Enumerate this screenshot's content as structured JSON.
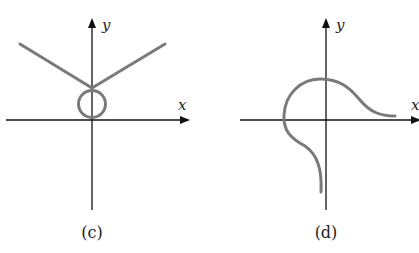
{
  "figures": [
    {
      "id": "c",
      "caption": "(c)",
      "x_axis_label": "x",
      "y_axis_label": "y",
      "description": "V-shaped curve whose two rays meet above the origin, with a small loop (circle) sitting between the vertex and the origin"
    },
    {
      "id": "d",
      "caption": "(d)",
      "x_axis_label": "x",
      "y_axis_label": "y",
      "description": "Curve starting below the x-axis near the negative y-axis, sweeping left and up into an arc crossing the y-axis above the origin, then descending and flattening out toward the positive x-axis"
    }
  ],
  "colors": {
    "axes": "#111111",
    "curve": "#7a7a7a"
  }
}
